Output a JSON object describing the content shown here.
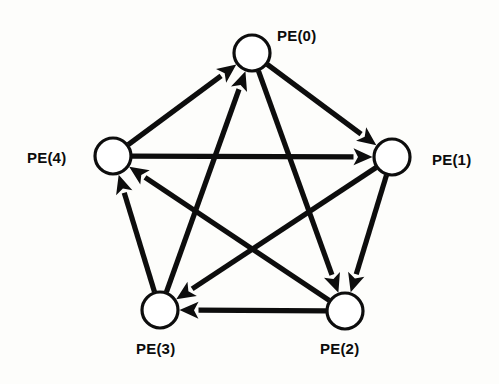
{
  "figure": {
    "type": "directed-graph",
    "background_color": "#fdfdfb",
    "stroke_color": "#0d0d0d",
    "node_fill_color": "#ffffff",
    "node_count": 5,
    "edge_count": 10
  },
  "nodes": [
    {
      "id": "PE0",
      "label": "PE(0)",
      "cx": 252,
      "cy": 53,
      "r": 18,
      "label_x": 277,
      "label_y": 28
    },
    {
      "id": "PE1",
      "label": "PE(1)",
      "cx": 392,
      "cy": 157,
      "r": 18,
      "label_x": 432,
      "label_y": 152
    },
    {
      "id": "PE2",
      "label": "PE(2)",
      "cx": 345,
      "cy": 311,
      "r": 18,
      "label_x": 320,
      "label_y": 341
    },
    {
      "id": "PE3",
      "label": "PE(3)",
      "cx": 160,
      "cy": 310,
      "r": 18,
      "label_x": 136,
      "label_y": 341
    },
    {
      "id": "PE4",
      "label": "PE(4)",
      "cx": 113,
      "cy": 156,
      "r": 18,
      "label_x": 27,
      "label_y": 150
    }
  ],
  "edges": [
    {
      "from": "PE4",
      "to": "PE0",
      "kind": "pentagon-side"
    },
    {
      "from": "PE0",
      "to": "PE1",
      "kind": "pentagon-side"
    },
    {
      "from": "PE1",
      "to": "PE2",
      "kind": "pentagon-side"
    },
    {
      "from": "PE2",
      "to": "PE3",
      "kind": "pentagon-side"
    },
    {
      "from": "PE3",
      "to": "PE4",
      "kind": "pentagon-side"
    },
    {
      "from": "PE3",
      "to": "PE0",
      "kind": "diagonal"
    },
    {
      "from": "PE0",
      "to": "PE2",
      "kind": "diagonal"
    },
    {
      "from": "PE2",
      "to": "PE4",
      "kind": "diagonal"
    },
    {
      "from": "PE4",
      "to": "PE1",
      "kind": "diagonal"
    },
    {
      "from": "PE1",
      "to": "PE3",
      "kind": "diagonal"
    }
  ]
}
